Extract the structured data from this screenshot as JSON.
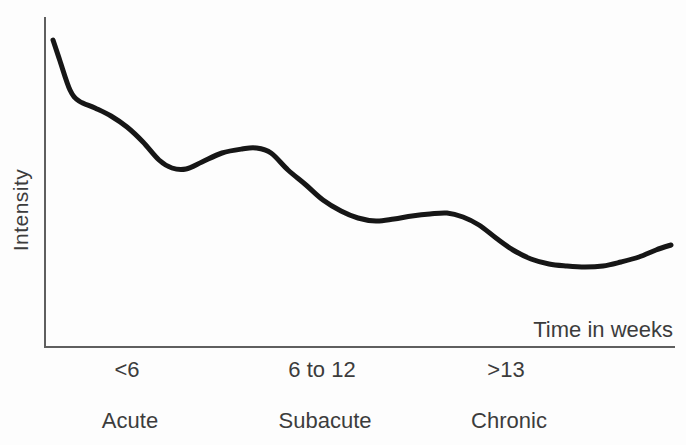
{
  "chart_data": {
    "type": "line",
    "title": "",
    "xlabel": "Time in weeks",
    "ylabel": "Intensity",
    "x_tick_labels": [
      "<6",
      "6 to 12",
      ">13"
    ],
    "phase_labels": [
      "Acute",
      "Subacute",
      "Chronic"
    ],
    "x_axis_note": "time axis divided into three unlabeled-scale phases",
    "y_axis_note": "qualitative intensity, no numeric scale; curve declines in steps with small rebounds",
    "curve_color": "#161616",
    "axis_color": "#5f5f5f",
    "text_color": "#3c3c3c",
    "curve_points": [
      [
        53,
        40
      ],
      [
        60,
        61
      ],
      [
        70,
        90
      ],
      [
        79,
        101
      ],
      [
        95,
        108
      ],
      [
        111,
        116
      ],
      [
        127,
        127
      ],
      [
        143,
        142
      ],
      [
        159,
        160
      ],
      [
        172,
        168
      ],
      [
        186,
        169
      ],
      [
        202,
        162
      ],
      [
        222,
        153
      ],
      [
        242,
        149
      ],
      [
        256,
        148
      ],
      [
        271,
        153
      ],
      [
        288,
        170
      ],
      [
        306,
        185
      ],
      [
        323,
        200
      ],
      [
        341,
        211
      ],
      [
        358,
        218
      ],
      [
        376,
        221
      ],
      [
        394,
        219
      ],
      [
        412,
        216
      ],
      [
        430,
        214
      ],
      [
        447,
        213
      ],
      [
        463,
        217
      ],
      [
        479,
        225
      ],
      [
        496,
        238
      ],
      [
        513,
        250
      ],
      [
        531,
        259
      ],
      [
        549,
        264
      ],
      [
        567,
        266
      ],
      [
        585,
        267
      ],
      [
        603,
        266
      ],
      [
        621,
        262
      ],
      [
        639,
        257
      ],
      [
        656,
        250
      ],
      [
        671,
        245
      ]
    ]
  }
}
